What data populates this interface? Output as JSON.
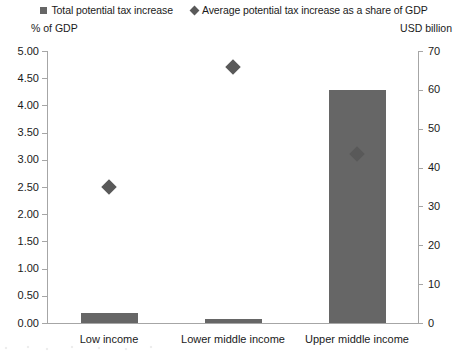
{
  "legend": {
    "entries": [
      {
        "label": "Total potential tax increase",
        "marker": "square-swatch-icon",
        "color": "#666666"
      },
      {
        "label": "Average potential tax increase as a share of GDP",
        "marker": "diamond-swatch-icon",
        "color": "#595959"
      }
    ]
  },
  "axes": {
    "left_caption": "% of GDP",
    "right_caption": "USD billion"
  },
  "chart_data": {
    "type": "bar",
    "title": "",
    "subtitle": "",
    "xlabel": "",
    "ylabel": "% of GDP",
    "y2label": "USD billion",
    "categories": [
      "Low income",
      "Lower middle income",
      "Upper middle income"
    ],
    "ylim": [
      0,
      5
    ],
    "y2lim": [
      0,
      70
    ],
    "yticks": [
      "0.00",
      "0.50",
      "1.00",
      "1.50",
      "2.00",
      "2.50",
      "3.00",
      "3.50",
      "4.00",
      "4.50",
      "5.00"
    ],
    "ytick_values": [
      0,
      0.5,
      1,
      1.5,
      2,
      2.5,
      3,
      3.5,
      4,
      4.5,
      5
    ],
    "y2ticks": [
      "0",
      "10",
      "20",
      "30",
      "40",
      "50",
      "60",
      "70"
    ],
    "y2tick_values": [
      0,
      10,
      20,
      30,
      40,
      50,
      60,
      70
    ],
    "grid": false,
    "legend_position": "top",
    "series": [
      {
        "name": "Total potential tax increase",
        "type": "bar",
        "axis": "y2",
        "unit": "USD billion",
        "color": "#666666",
        "values": [
          2.6,
          1.0,
          60.0
        ]
      },
      {
        "name": "Average potential tax increase as a share of GDP",
        "type": "scatter",
        "marker": "diamond",
        "axis": "y",
        "unit": "% of GDP",
        "color": "#595959",
        "values": [
          2.5,
          4.7,
          3.1
        ]
      }
    ]
  }
}
